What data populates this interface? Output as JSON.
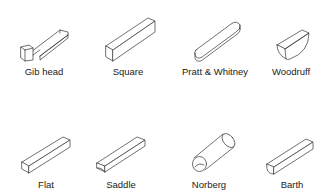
{
  "diagram": {
    "title": "",
    "background": "#ffffff",
    "line_color": "#333333",
    "rows": [
      {
        "items": [
          {
            "id": "gib-head",
            "label": "Gib head",
            "label_x": 44,
            "label_y": 69
          },
          {
            "id": "square",
            "label": "Square",
            "label_x": 128,
            "label_y": 69
          },
          {
            "id": "pratt-whitney",
            "label": "Pratt & Whitney",
            "label_x": 215,
            "label_y": 69
          },
          {
            "id": "woodruff",
            "label": "Woodruff",
            "label_x": 290,
            "label_y": 69
          }
        ]
      },
      {
        "items": [
          {
            "id": "flat",
            "label": "Flat",
            "label_x": 46,
            "label_y": 181
          },
          {
            "id": "saddle",
            "label": "Saddle",
            "label_x": 121,
            "label_y": 181
          },
          {
            "id": "norberg",
            "label": "Norberg",
            "label_x": 209,
            "label_y": 181
          },
          {
            "id": "barth",
            "label": "Barth",
            "label_x": 292,
            "label_y": 181
          }
        ]
      }
    ]
  }
}
